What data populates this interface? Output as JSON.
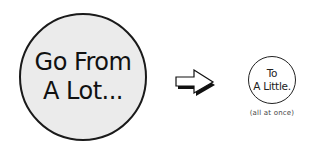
{
  "left_bubble": {
    "lines": [
      "Go From",
      "A Lot..."
    ],
    "fill": "#ebebeb"
  },
  "arrow": {
    "icon": "right-arrow-icon"
  },
  "right_bubble": {
    "lines": [
      "To",
      "A Little."
    ],
    "fill": "#ffffff"
  },
  "caption": "(all at once)"
}
